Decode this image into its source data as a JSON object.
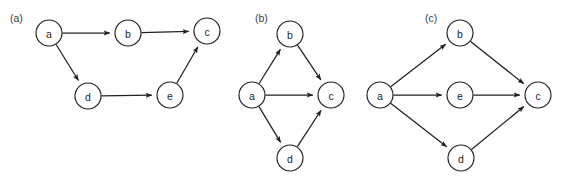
{
  "figure": {
    "background_color": "#ffffff",
    "stroke_color": "#231f20",
    "node_fill": "#ffffff",
    "label_color": "#3b3a3c",
    "watermark_text": "",
    "node_radius": 13
  },
  "panels": [
    {
      "id": "panel-a",
      "label": "(a)",
      "label_x": 10,
      "label_y": 18,
      "nodes": [
        {
          "id": "a",
          "label": "a",
          "x": 49,
          "y": 33
        },
        {
          "id": "b",
          "label": "b",
          "x": 128,
          "y": 33
        },
        {
          "id": "c",
          "label": "c",
          "x": 207,
          "y": 31
        },
        {
          "id": "d",
          "label": "d",
          "x": 88,
          "y": 96
        },
        {
          "id": "e",
          "label": "e",
          "x": 170,
          "y": 95
        }
      ],
      "edges": [
        {
          "from": "a",
          "to": "b"
        },
        {
          "from": "b",
          "to": "c"
        },
        {
          "from": "a",
          "to": "d"
        },
        {
          "from": "d",
          "to": "e"
        },
        {
          "from": "e",
          "to": "c"
        }
      ]
    },
    {
      "id": "panel-b",
      "label": "(b)",
      "label_x": 255,
      "label_y": 18,
      "nodes": [
        {
          "id": "a",
          "label": "a",
          "x": 252,
          "y": 95
        },
        {
          "id": "b",
          "label": "b",
          "x": 290,
          "y": 34
        },
        {
          "id": "c",
          "label": "c",
          "x": 331,
          "y": 95
        },
        {
          "id": "d",
          "label": "d",
          "x": 290,
          "y": 158
        }
      ],
      "edges": [
        {
          "from": "a",
          "to": "b"
        },
        {
          "from": "a",
          "to": "c"
        },
        {
          "from": "a",
          "to": "d"
        },
        {
          "from": "b",
          "to": "c"
        },
        {
          "from": "d",
          "to": "c"
        }
      ]
    },
    {
      "id": "panel-c",
      "label": "(c)",
      "label_x": 425,
      "label_y": 18,
      "nodes": [
        {
          "id": "a",
          "label": "a",
          "x": 380,
          "y": 95
        },
        {
          "id": "b",
          "label": "b",
          "x": 460,
          "y": 33
        },
        {
          "id": "e",
          "label": "e",
          "x": 460,
          "y": 95
        },
        {
          "id": "c",
          "label": "c",
          "x": 538,
          "y": 95
        },
        {
          "id": "d",
          "label": "d",
          "x": 461,
          "y": 158
        }
      ],
      "edges": [
        {
          "from": "a",
          "to": "b"
        },
        {
          "from": "a",
          "to": "e"
        },
        {
          "from": "a",
          "to": "d"
        },
        {
          "from": "b",
          "to": "c"
        },
        {
          "from": "e",
          "to": "c"
        },
        {
          "from": "d",
          "to": "c"
        }
      ]
    }
  ]
}
